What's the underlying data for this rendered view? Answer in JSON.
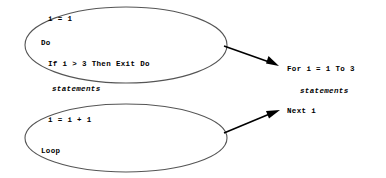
{
  "diagram": {
    "type": "flow-comparison",
    "stroke_color": "#4a4a4a",
    "arrow_color": "#000000",
    "text_color": "#000000",
    "background_color": "#ffffff"
  },
  "left_block": {
    "ellipse_top": {
      "name": "do-loop-header-ellipse",
      "lines": {
        "init": "i = 1",
        "do": "Do",
        "if_exit": "If i > 3 Then Exit Do"
      }
    },
    "between": {
      "statements": "statements"
    },
    "ellipse_bottom": {
      "name": "do-loop-footer-ellipse",
      "lines": {
        "increment": "i = i + 1",
        "loop": "Loop"
      }
    }
  },
  "right_block": {
    "name": "for-next-equivalent",
    "lines": {
      "for": "For i = 1 To 3",
      "statements": "statements",
      "next": "Next i"
    }
  },
  "connectors": [
    {
      "name": "arrow-header-to-for",
      "from": "do-loop-header-ellipse",
      "to": "for-line"
    },
    {
      "name": "arrow-footer-to-next",
      "from": "do-loop-footer-ellipse",
      "to": "next-line"
    }
  ]
}
